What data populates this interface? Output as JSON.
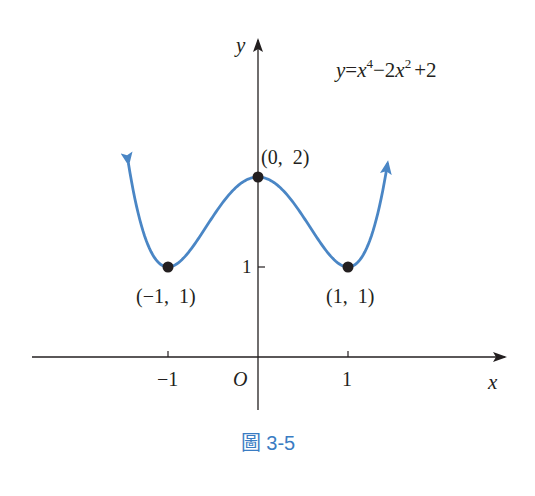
{
  "caption": "圖 3-5",
  "equation": {
    "y": "y",
    "eq": "=",
    "x1": "x",
    "e1": "4",
    "minus2": "−2",
    "x2": "x",
    "e2": "2",
    "plus2": "+2"
  },
  "axes": {
    "x_label": "x",
    "y_label": "y",
    "origin_label": "O"
  },
  "ticks": {
    "x_neg1": "−1",
    "x_1": "1",
    "y_1": "1"
  },
  "points": {
    "p1": "(−1,  1)",
    "p2": "(0,  2)",
    "p3": "(1,  1)"
  },
  "colors": {
    "curve": "#4a86c5",
    "caption": "#3a7cc3",
    "axis": "#231f20"
  },
  "chart_data": {
    "type": "line",
    "xlabel": "x",
    "ylabel": "y",
    "function": "y = x^4 - 2x^2 + 2",
    "x_range": [
      -1.44,
      1.44
    ],
    "x": [
      -1.44,
      -1.2,
      -1.0,
      -0.6,
      0.0,
      0.6,
      1.0,
      1.2,
      1.44
    ],
    "series": [
      {
        "name": "y = x^4 − 2x^2 + 2",
        "values": [
          2.15,
          1.19,
          1.0,
          1.41,
          2.0,
          1.41,
          1.0,
          1.19,
          2.15
        ]
      }
    ],
    "marked_points": [
      {
        "x": -1,
        "y": 1,
        "label": "(−1, 1)"
      },
      {
        "x": 0,
        "y": 2,
        "label": "(0, 2)"
      },
      {
        "x": 1,
        "y": 1,
        "label": "(1, 1)"
      }
    ],
    "x_ticks": [
      -1,
      1
    ],
    "y_ticks": [
      1
    ],
    "grid": false,
    "caption": "圖 3-5"
  }
}
